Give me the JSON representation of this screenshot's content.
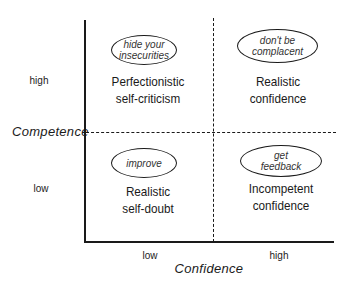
{
  "diagram": {
    "type": "2x2 quadrant",
    "y_axis": {
      "title": "Competence",
      "ticks": [
        "high",
        "low"
      ]
    },
    "x_axis": {
      "title": "Confidence",
      "ticks": [
        "low",
        "high"
      ]
    },
    "quadrants": [
      {
        "position": "top-left",
        "advice": "hide your insecurities",
        "advice_lines": [
          "hide your",
          "insecurities"
        ],
        "label_lines": [
          "Perfectionistic",
          "self-criticism"
        ]
      },
      {
        "position": "top-right",
        "advice": "don't be complacent",
        "advice_lines": [
          "don't be",
          "complacent"
        ],
        "label_lines": [
          "Realistic",
          "confidence"
        ]
      },
      {
        "position": "bottom-left",
        "advice": "improve",
        "advice_lines": [
          "improve"
        ],
        "label_lines": [
          "Realistic",
          "self-doubt"
        ]
      },
      {
        "position": "bottom-right",
        "advice": "get feedback",
        "advice_lines": [
          "get",
          "feedback"
        ],
        "label_lines": [
          "Incompetent",
          "confidence"
        ]
      }
    ]
  }
}
